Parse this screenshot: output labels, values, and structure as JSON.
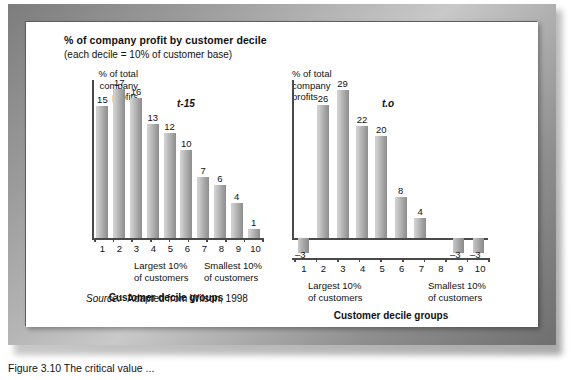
{
  "figure": {
    "title": "% of company profit by customer decile",
    "subtitle": "(each decile = 10% of customer base)",
    "source": "Source:",
    "source_text": "Adapted from Wilson, 1998",
    "caption": "Figure  3.10   The critical value ..."
  },
  "chart_data": [
    {
      "type": "bar",
      "panel": "left",
      "series_tag": "t-15",
      "ylabel": "% of total\ncompany\nprofits",
      "ylabel_lines": [
        "% of total",
        "company",
        "profits"
      ],
      "xlabel": "Customer decile groups",
      "categories": [
        "1",
        "2",
        "3",
        "4",
        "5",
        "6",
        "7",
        "8",
        "9",
        "10"
      ],
      "values": [
        15,
        17,
        16,
        13,
        12,
        10,
        7,
        6,
        4,
        1
      ],
      "ylim": [
        0,
        18
      ],
      "grid": false,
      "legend": "none",
      "note_left": [
        "Largest 10%",
        "of customers"
      ],
      "note_right": [
        "Smallest 10%",
        "of customers"
      ]
    },
    {
      "type": "bar",
      "panel": "right",
      "series_tag": "t.o",
      "ylabel": "% of total\ncompany\nprofits",
      "ylabel_lines": [
        "% of total",
        "company",
        "profits"
      ],
      "xlabel": "Customer decile groups",
      "categories": [
        "1",
        "2",
        "3",
        "4",
        "5",
        "6",
        "7",
        "8",
        "9",
        "10"
      ],
      "values": [
        -3,
        26,
        29,
        22,
        20,
        8,
        4,
        0,
        -3,
        -3
      ],
      "value_labels": [
        "–3",
        "26",
        "29",
        "22",
        "20",
        "8",
        "4",
        "",
        "–3",
        "–3"
      ],
      "ylim": [
        -5,
        31
      ],
      "grid": false,
      "legend": "none",
      "note_left": [
        "Largest 10%",
        "of customers"
      ],
      "note_right": [
        "Smallest 10%",
        "of customers"
      ]
    }
  ],
  "colors": {
    "bar_light": "#d2d2d2",
    "bar_dark": "#8d8d8d",
    "axis": "#4a4a4a",
    "text": "#111111",
    "frame": "#9c9c9c",
    "canvas": "#ffffff"
  }
}
